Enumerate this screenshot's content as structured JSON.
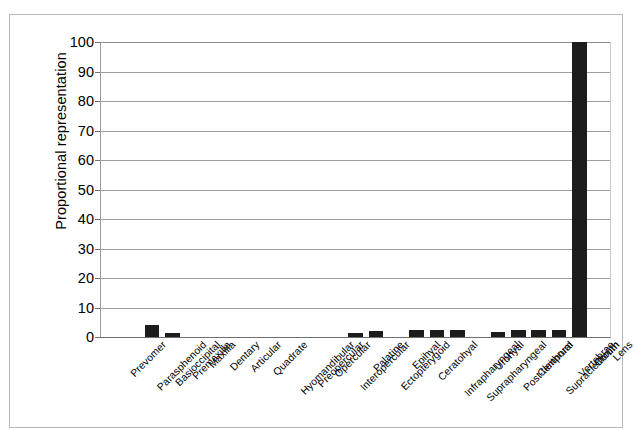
{
  "chart_data": {
    "type": "bar",
    "title": "",
    "subtitle": "",
    "xlabel": "",
    "ylabel": "Proportional representation",
    "ylim": [
      0,
      100
    ],
    "ytick_step": 10,
    "yticks": [
      0,
      10,
      20,
      30,
      40,
      50,
      60,
      70,
      80,
      90,
      100
    ],
    "grid": "horizontal",
    "legend": "none",
    "bar_color": "#1c1c1c",
    "categories": [
      "Prevomer",
      "Parasphenoid",
      "Basioccipital",
      "Premaxilla",
      "Maxilla",
      "Dentary",
      "Articular",
      "Quadrate",
      "Hyomandibular",
      "Preopercular",
      "Opercular",
      "Interopercular",
      "Palatine",
      "Ectopterygoid",
      "Epihyal",
      "Ceratohyal",
      "Infrapharyngeal",
      "Suprapharyngeal",
      "Urohyal",
      "Post-temporal",
      "Cleithrum",
      "Supracleithrum",
      "Vertebrae",
      "Otolith",
      "Lens"
    ],
    "values": [
      0,
      0,
      4.2,
      1.4,
      0,
      0,
      0,
      0,
      0,
      0,
      0,
      0,
      1.3,
      2.2,
      0,
      2.4,
      2.4,
      2.4,
      0,
      1.6,
      2.4,
      2.4,
      2.4,
      100,
      0
    ]
  }
}
